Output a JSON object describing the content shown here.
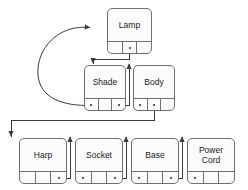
{
  "diagram": {
    "background_color": "#ffffff",
    "stroke_color": "#6f6f6f",
    "node_fill": "#fbfbfb",
    "text_color": "#1a1a1a"
  },
  "nodes": [
    {
      "id": "lamp",
      "label": "Lamp",
      "x": 107,
      "y": 8,
      "w": 45,
      "h": 46,
      "slots": [
        {
          "name": "slot-left",
          "dot": false
        },
        {
          "name": "slot-middle",
          "dot": true
        },
        {
          "name": "slot-right",
          "dot": false
        }
      ]
    },
    {
      "id": "shade",
      "label": "Shade",
      "x": 84,
      "y": 65,
      "w": 42,
      "h": 46,
      "slots": [
        {
          "name": "slot-left",
          "dot": true
        },
        {
          "name": "slot-middle",
          "dot": false
        },
        {
          "name": "slot-right",
          "dot": true
        }
      ]
    },
    {
      "id": "body",
      "label": "Body",
      "x": 133,
      "y": 65,
      "w": 42,
      "h": 46,
      "slots": [
        {
          "name": "slot-left",
          "dot": true
        },
        {
          "name": "slot-middle",
          "dot": true
        },
        {
          "name": "slot-right",
          "dot": false
        }
      ]
    },
    {
      "id": "harp",
      "label": "Harp",
      "x": 19,
      "y": 138,
      "w": 48,
      "h": 46,
      "slots": [
        {
          "name": "slot-left",
          "dot": false
        },
        {
          "name": "slot-middle",
          "dot": false
        },
        {
          "name": "slot-right",
          "dot": true
        }
      ]
    },
    {
      "id": "socket",
      "label": "Socket",
      "x": 75,
      "y": 138,
      "w": 48,
      "h": 46,
      "slots": [
        {
          "name": "slot-left",
          "dot": true
        },
        {
          "name": "slot-middle",
          "dot": false
        },
        {
          "name": "slot-right",
          "dot": true
        }
      ]
    },
    {
      "id": "base",
      "label": "Base",
      "x": 131,
      "y": 138,
      "w": 48,
      "h": 46,
      "slots": [
        {
          "name": "slot-left",
          "dot": true
        },
        {
          "name": "slot-middle",
          "dot": false
        },
        {
          "name": "slot-right",
          "dot": true
        }
      ]
    },
    {
      "id": "power-cord",
      "label": "Power\nCord",
      "x": 187,
      "y": 138,
      "w": 48,
      "h": 46,
      "slots": [
        {
          "name": "slot-left",
          "dot": true
        },
        {
          "name": "slot-middle",
          "dot": false
        },
        {
          "name": "slot-right",
          "dot": false
        }
      ]
    }
  ],
  "connections": [
    {
      "id": "lamp-to-shade",
      "from": "lamp.slot-middle",
      "to": "shade.top",
      "style": "orthogonal"
    },
    {
      "id": "shade-to-body",
      "from": "shade.slot-right",
      "to": "body.top",
      "style": "orthogonal"
    },
    {
      "id": "shade-to-lamp",
      "from": "shade.slot-left",
      "to": "lamp.left",
      "style": "curved"
    },
    {
      "id": "body-to-harp",
      "from": "body.slot-middle",
      "to": "harp.top",
      "style": "orthogonal"
    },
    {
      "id": "harp-to-socket",
      "from": "harp.slot-right",
      "to": "socket.top",
      "style": "orthogonal"
    },
    {
      "id": "socket-to-base",
      "from": "socket.slot-right",
      "to": "base.top",
      "style": "orthogonal"
    },
    {
      "id": "base-to-powercord",
      "from": "base.slot-right",
      "to": "power-cord.top",
      "style": "orthogonal"
    }
  ]
}
